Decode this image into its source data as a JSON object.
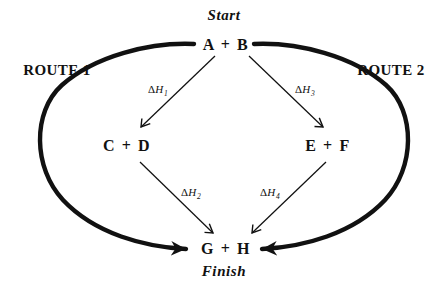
{
  "diagram": {
    "type": "energy-cycle",
    "title_top": "Start",
    "title_bottom": "Finish",
    "ink_color": "#111111",
    "background_color": "#ffffff",
    "routes": [
      {
        "id": "route-1",
        "label": "ROUTE 1",
        "side": "left"
      },
      {
        "id": "route-2",
        "label": "ROUTE 2",
        "side": "right"
      }
    ],
    "nodes": [
      {
        "id": "node-ab",
        "label": "A  +  B",
        "position": "top-center"
      },
      {
        "id": "node-cd",
        "label": "C  +  D",
        "position": "middle-left"
      },
      {
        "id": "node-ef",
        "label": "E  +  F",
        "position": "middle-right"
      },
      {
        "id": "node-gh",
        "label": "G  +  H",
        "position": "bottom-center"
      }
    ],
    "enthalpy_arrows": [
      {
        "id": "dh1",
        "delta": "Δ",
        "symbol": "H",
        "subscript": "1",
        "from": "node-ab",
        "to": "node-cd"
      },
      {
        "id": "dh2",
        "delta": "Δ",
        "symbol": "H",
        "subscript": "2",
        "from": "node-cd",
        "to": "node-gh"
      },
      {
        "id": "dh3",
        "delta": "Δ",
        "symbol": "H",
        "subscript": "3",
        "from": "node-ab",
        "to": "node-ef"
      },
      {
        "id": "dh4",
        "delta": "Δ",
        "symbol": "H",
        "subscript": "4",
        "from": "node-ef",
        "to": "node-gh"
      }
    ],
    "ellipse_arrows": [
      {
        "id": "ellipse-left-arc",
        "from": "node-ab",
        "to": "node-gh",
        "side": "left"
      },
      {
        "id": "ellipse-right-arc",
        "from": "node-ab",
        "to": "node-gh",
        "side": "right"
      }
    ]
  }
}
